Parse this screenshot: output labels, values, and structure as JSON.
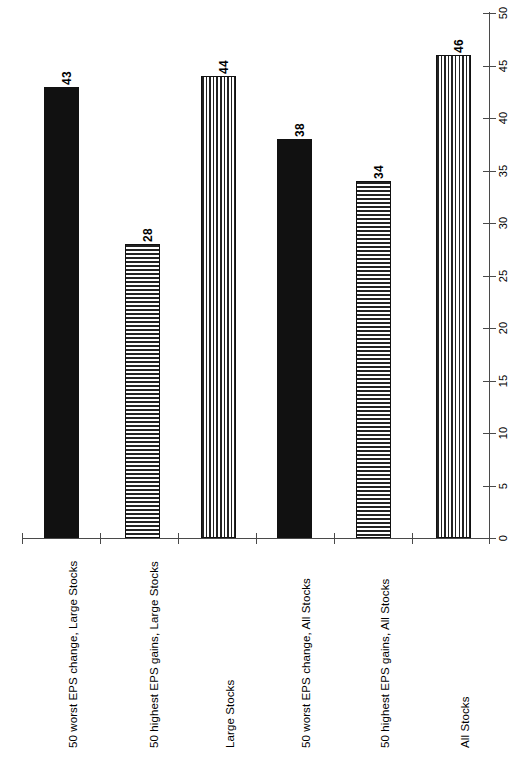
{
  "chart_data": {
    "type": "bar",
    "orientation": "vertical-bars-rotated-page",
    "title": "",
    "subtitle": "",
    "xlabel": "",
    "ylabel": "",
    "ylim": [
      0,
      50
    ],
    "grid": false,
    "legend": "none",
    "categories": [
      "50 worst EPS change, Large Stocks",
      "50 highest EPS gains, Large Stocks",
      "Large Stocks",
      "50 worst EPS change, All Stocks",
      "50 highest EPS gains, All Stocks",
      "All Stocks"
    ],
    "values": [
      43,
      28,
      44,
      38,
      34,
      46
    ],
    "value_labels": [
      "43",
      "28",
      "44",
      "38",
      "34",
      "46"
    ],
    "bar_patterns": [
      "solid",
      "horizontal",
      "vertical",
      "solid",
      "horizontal",
      "vertical"
    ],
    "tick_labels": [
      "0",
      "5",
      "10",
      "15",
      "20",
      "25",
      "30",
      "35",
      "40",
      "45",
      "50"
    ],
    "tick_values": [
      0,
      5,
      10,
      15,
      20,
      25,
      30,
      35,
      40,
      45,
      50
    ]
  },
  "colors": {
    "bar_solid": "#111111",
    "pattern_stroke": "#222222",
    "axis": "#4a4a4a",
    "background": "#ffffff",
    "text": "#000000"
  }
}
